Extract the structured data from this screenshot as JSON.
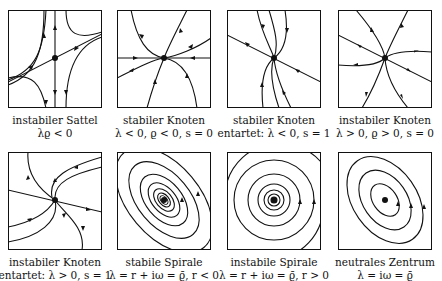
{
  "top_fragment": "…",
  "panels": [
    {
      "name": "instabiler-sattel",
      "title": "instabiler Sattel",
      "condition": "λϱ < 0"
    },
    {
      "name": "stabiler-knoten",
      "title": "stabiler Knoten",
      "condition": "λ < 0, ϱ < 0, s = 0"
    },
    {
      "name": "stabiler-knoten-entartet",
      "title": "stabiler Knoten",
      "condition": "entartet:  λ < 0, s = 1"
    },
    {
      "name": "instabiler-knoten",
      "title": "instabiler Knoten",
      "condition": "λ > 0, ϱ > 0, s = 0"
    },
    {
      "name": "instabiler-knoten-entartet",
      "title": "instabiler Knoten",
      "condition": "entartet:  λ > 0, s = 1"
    },
    {
      "name": "stabile-spirale",
      "title": "stabile Spirale",
      "condition": "λ = r + iω = ϱ̄, r < 0"
    },
    {
      "name": "instabile-spirale",
      "title": "instabile Spirale",
      "condition": "λ = r + iω = ϱ̄, r > 0"
    },
    {
      "name": "neutrales-zentrum",
      "title": "neutrales Zentrum",
      "condition": "λ = iω = ϱ̄"
    }
  ]
}
